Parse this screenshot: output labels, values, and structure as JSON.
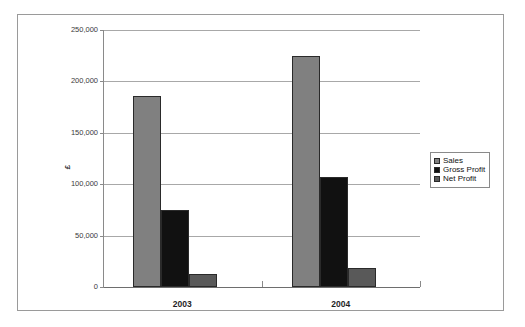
{
  "chart_data": {
    "type": "bar",
    "title": "",
    "subtitle": "",
    "xlabel": "",
    "ylabel": "£",
    "categories": [
      "2003",
      "2004"
    ],
    "series": [
      {
        "name": "Sales",
        "color": "#808080",
        "values": [
          186000,
          224500
        ]
      },
      {
        "name": "Gross Profit",
        "color": "#111111",
        "values": [
          75000,
          107000
        ]
      },
      {
        "name": "Net Profit",
        "color": "#595959",
        "values": [
          12500,
          18500
        ]
      }
    ],
    "ylim": [
      0,
      250000
    ],
    "ytick_values": [
      0,
      50000,
      100000,
      150000,
      200000,
      250000
    ],
    "ytick_labels": [
      "0",
      "50,000",
      "100,000",
      "150,000",
      "200,000",
      "250,000"
    ],
    "grid": true,
    "legend_position": "right"
  },
  "legend": {
    "entries": [
      {
        "label": "Sales"
      },
      {
        "label": "Gross Profit"
      },
      {
        "label": "Net Profit"
      }
    ]
  },
  "axis": {
    "y_title": "£"
  },
  "colors": {
    "sales": "#808080",
    "gross_profit": "#111111",
    "net_profit": "#595959",
    "frame": "#9a9a9a",
    "gridline": "#a8a8a8",
    "background": "#ffffff"
  }
}
